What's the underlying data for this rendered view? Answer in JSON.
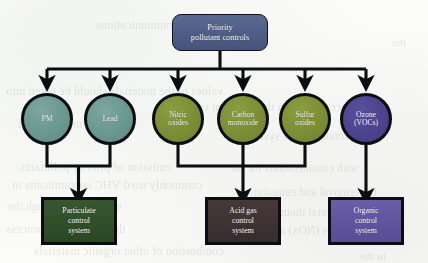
{
  "diagram": {
    "root": {
      "id": "priority-pollutant-controls",
      "line1": "Priority",
      "line2": "pollutant controls",
      "color": "#4e5d86",
      "shape": "rounded-rectangle"
    },
    "pollutants": [
      {
        "id": "pm",
        "line1": "PM",
        "line2": "",
        "color": "#6d9a92",
        "group": "particulate"
      },
      {
        "id": "lead",
        "line1": "Lead",
        "line2": "",
        "color": "#6d9a92",
        "group": "particulate"
      },
      {
        "id": "nitric-oxides",
        "line1": "Nitric",
        "line2": "oxides",
        "color": "#7d9036",
        "group": "acid-gas"
      },
      {
        "id": "carbon-monoxide",
        "line1": "Carbon",
        "line2": "monoxide",
        "color": "#7d9036",
        "group": "acid-gas"
      },
      {
        "id": "sulfur-oxides",
        "line1": "Sulfur",
        "line2": "oxides",
        "color": "#7d9036",
        "group": "acid-gas"
      },
      {
        "id": "ozone-vocs",
        "line1": "Ozone",
        "line2": "(VOCs)",
        "color": "#4d4490",
        "group": "organic"
      }
    ],
    "control_systems": [
      {
        "id": "particulate-control-system",
        "line1": "Particulate",
        "line2": "control",
        "line3": "system",
        "color": "#2f4f29"
      },
      {
        "id": "acid-gas-control-system",
        "line1": "Acid gas",
        "line2": "control",
        "line3": "system",
        "color": "#3e3233"
      },
      {
        "id": "organic-control-system",
        "line1": "Organic",
        "line2": "control",
        "line3": "system",
        "color": "#61549f"
      }
    ],
    "connector_color": "#0b0d10",
    "background_color": "#fbfbf8"
  },
  "page_bleed": {
    "lines": [
      {
        "text": "communications",
        "x": 96,
        "y": 18,
        "size": 12
      },
      {
        "text": "the",
        "x": 392,
        "y": 36,
        "size": 11
      },
      {
        "text": "values of the materials should be taken into",
        "x": 6,
        "y": 84,
        "size": 12
      },
      {
        "text": "account when the pollutant is",
        "x": 200,
        "y": 100,
        "size": 12
      },
      {
        "text": "relative to the control",
        "x": 18,
        "y": 118,
        "size": 11.5
      },
      {
        "text": "reduction and the system",
        "x": 246,
        "y": 130,
        "size": 11.5
      },
      {
        "text": "emission of priority pollutants",
        "x": 20,
        "y": 160,
        "size": 12
      },
      {
        "text": "with considerations for the",
        "x": 230,
        "y": 162,
        "size": 11.5
      },
      {
        "text": "commonly used VHC contaminants in",
        "x": 12,
        "y": 178,
        "size": 12
      },
      {
        "text": "the removal and emissions of",
        "x": 236,
        "y": 186,
        "size": 11.5
      },
      {
        "text": "exhaust gas through the",
        "x": 8,
        "y": 200,
        "size": 11.5
      },
      {
        "text": "of several thousand",
        "x": 262,
        "y": 206,
        "size": 11.5
      },
      {
        "text": "the lead and the process",
        "x": 6,
        "y": 222,
        "size": 12
      },
      {
        "text": "sources (NOx) and",
        "x": 268,
        "y": 224,
        "size": 11.5
      },
      {
        "text": "combustion of other organic materials",
        "x": 34,
        "y": 244,
        "size": 12
      },
      {
        "text": "in the",
        "x": 360,
        "y": 250,
        "size": 11
      }
    ]
  }
}
